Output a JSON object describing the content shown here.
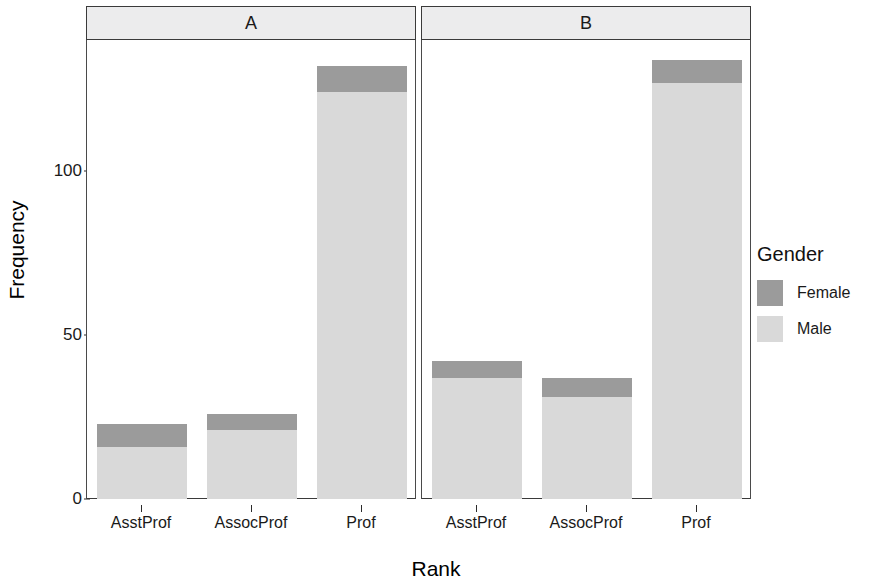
{
  "chart_data": {
    "type": "bar",
    "subtype": "stacked-bar-faceted",
    "title": "",
    "xlabel": "Rank",
    "ylabel": "Frequency",
    "categories": [
      "AsstProf",
      "AssocProf",
      "Prof"
    ],
    "ylim": [
      0,
      140
    ],
    "yticks": [
      0,
      50,
      100
    ],
    "ytick_labels": [
      "0",
      "50",
      "100"
    ],
    "grid": false,
    "legend": {
      "title": "Gender",
      "position": "right",
      "entries": [
        {
          "name": "Female",
          "color": "#9b9b9b"
        },
        {
          "name": "Male",
          "color": "#d9d9d9"
        }
      ]
    },
    "facets": [
      {
        "label": "A",
        "series": [
          {
            "name": "Male",
            "color": "#d9d9d9",
            "values": [
              16,
              21,
              124
            ]
          },
          {
            "name": "Female",
            "color": "#9b9b9b",
            "values": [
              7,
              5,
              8
            ]
          }
        ],
        "totals": [
          23,
          26,
          132
        ]
      },
      {
        "label": "B",
        "series": [
          {
            "name": "Male",
            "color": "#d9d9d9",
            "values": [
              37,
              31,
              127
            ]
          },
          {
            "name": "Female",
            "color": "#9b9b9b",
            "values": [
              5,
              6,
              7
            ]
          }
        ],
        "totals": [
          42,
          37,
          134
        ]
      }
    ]
  },
  "axes": {
    "y_title": "Frequency",
    "x_title": "Rank"
  }
}
